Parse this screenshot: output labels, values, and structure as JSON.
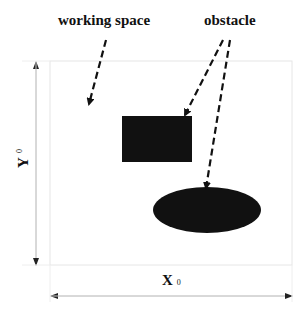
{
  "diagram": {
    "title": "",
    "labels": {
      "working_space": "working space",
      "obstacle": "obstacle",
      "x_axis": "X",
      "x_sub": "0",
      "y_axis": "Y",
      "y_sub": "0"
    },
    "nodes": [
      {
        "id": "workspace",
        "shape": "rectangle",
        "x": 50,
        "y": 61,
        "w": 242,
        "h": 204,
        "fill": "#ffffff",
        "stroke": "#e6e6e6"
      },
      {
        "id": "obstacle-rect",
        "shape": "rectangle",
        "x": 122,
        "y": 116,
        "w": 70,
        "h": 46,
        "fill": "#111111"
      },
      {
        "id": "obstacle-ellipse",
        "shape": "ellipse",
        "cx": 207,
        "cy": 210,
        "rx": 54,
        "ry": 23,
        "fill": "#111111"
      }
    ],
    "edges": [
      {
        "from": "working_space_label",
        "to": "workspace",
        "style": "dashed",
        "x1": 106,
        "y1": 40,
        "x2": 89,
        "y2": 104
      },
      {
        "from": "obstacle_label",
        "to": "obstacle-rect",
        "style": "dashed",
        "x1": 223,
        "y1": 40,
        "x2": 185,
        "y2": 115
      },
      {
        "from": "obstacle_label",
        "to": "obstacle-ellipse",
        "style": "dashed",
        "x1": 230,
        "y1": 40,
        "x2": 206,
        "y2": 188
      }
    ],
    "dimensions": [
      {
        "id": "y0-dimension",
        "orientation": "vertical",
        "x": 36,
        "y1": 61,
        "y2": 265
      },
      {
        "id": "x0-dimension",
        "orientation": "horizontal",
        "y": 296,
        "x1": 50,
        "x2": 292
      }
    ],
    "colors": {
      "ink": "#111111",
      "frame": "#e6e6e6",
      "dimension_line": "#cccccc"
    }
  }
}
